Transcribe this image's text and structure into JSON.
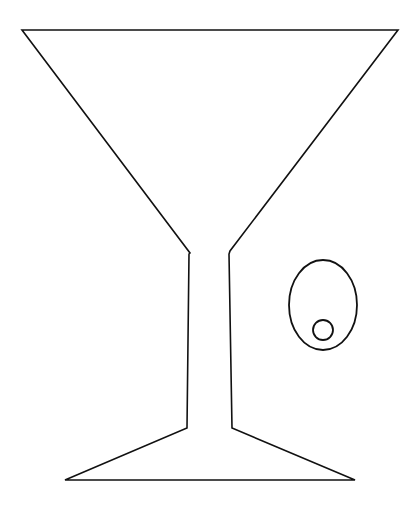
{
  "illustration": {
    "subject": "martini glass with olive",
    "background": "#ffffff",
    "stroke_color": "#111111",
    "glass": {
      "rim": {
        "x1": 22,
        "y1": 30,
        "x2": 398,
        "y2": 30
      },
      "bowl_left_join": {
        "x": 190,
        "y": 253
      },
      "bowl_right_join": {
        "x": 230,
        "y": 251
      },
      "stem_left_bottom": {
        "x": 187,
        "y": 428
      },
      "stem_right_bottom": {
        "x": 232,
        "y": 428
      },
      "foot_left": {
        "x": 65,
        "y": 480
      },
      "foot_right": {
        "x": 355,
        "y": 480
      }
    },
    "olive": {
      "cx": 323,
      "cy": 305,
      "rx": 34,
      "ry": 45
    },
    "pimento": {
      "cx": 323,
      "cy": 330,
      "r": 10
    }
  }
}
